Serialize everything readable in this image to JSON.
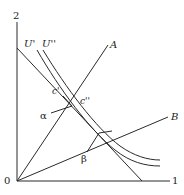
{
  "diagram": {
    "axis_labels": {
      "origin": "0",
      "y_max": "2",
      "x_max": "1"
    },
    "curve_labels": {
      "u_prime": "U'",
      "u_double_prime": "U''"
    },
    "ray_labels": {
      "a": "A",
      "b": "B"
    },
    "point_labels": {
      "c_prime": "c'",
      "c_double_prime": "c''",
      "alpha": "α",
      "beta": "β"
    },
    "colors": {
      "line": "#2a2a2a",
      "background": "#ffffff"
    }
  }
}
